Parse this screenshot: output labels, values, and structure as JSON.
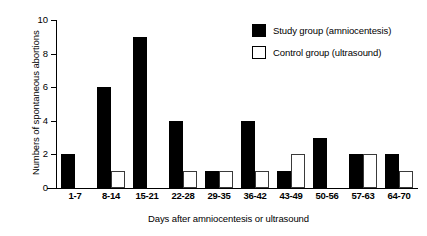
{
  "chart_data": {
    "type": "bar",
    "title": "",
    "xlabel": "Days after amniocentesis or ultrasound",
    "ylabel": "Numbers of spontaneous abortions",
    "categories": [
      "1-7",
      "8-14",
      "15-21",
      "22-28",
      "29-35",
      "36-42",
      "43-49",
      "50-56",
      "57-63",
      "64-70"
    ],
    "series": [
      {
        "name": "Study group (amniocentesis)",
        "color": "#000000",
        "values": [
          2,
          6,
          9,
          4,
          1,
          4,
          1,
          3,
          2,
          2
        ]
      },
      {
        "name": "Control group (ultrasound)",
        "color": "#ffffff",
        "values": [
          0,
          1,
          0,
          1,
          1,
          1,
          2,
          0,
          2,
          1
        ]
      }
    ],
    "ylim": [
      0,
      10
    ],
    "yticks": [
      0,
      2,
      4,
      6,
      8,
      10
    ],
    "ytick_labels": [
      "0",
      "2",
      "4",
      "6",
      "8",
      "10"
    ],
    "grid": false,
    "legend_position": "top-right"
  },
  "legend": {
    "entries": [
      {
        "label": "Study group (amniocentesis)",
        "swatch": "filled-black"
      },
      {
        "label": "Control group (ultrasound)",
        "swatch": "outlined-white"
      }
    ]
  }
}
